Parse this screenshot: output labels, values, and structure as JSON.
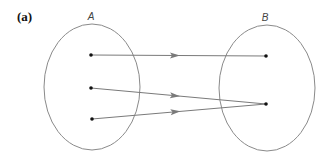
{
  "figure": {
    "panel_label": "(a)",
    "sets": [
      {
        "label": "A",
        "cx": 92,
        "cy": 87,
        "rx": 48,
        "ry": 63,
        "label_x": 91,
        "label_y": 20
      },
      {
        "label": "B",
        "cx": 267,
        "cy": 88,
        "rx": 48,
        "ry": 63,
        "label_x": 265,
        "label_y": 21
      }
    ],
    "points_A": [
      {
        "x": 91,
        "y": 55
      },
      {
        "x": 91,
        "y": 88
      },
      {
        "x": 92,
        "y": 119
      }
    ],
    "points_B": [
      {
        "x": 266,
        "y": 56
      },
      {
        "x": 266,
        "y": 104
      }
    ],
    "mappings": [
      {
        "from": 0,
        "to": 0
      },
      {
        "from": 1,
        "to": 1
      },
      {
        "from": 2,
        "to": 1
      }
    ],
    "colors": {
      "ellipse": "#8a8a8a",
      "arrow": "#7a7a7a",
      "point": "#111111"
    }
  }
}
